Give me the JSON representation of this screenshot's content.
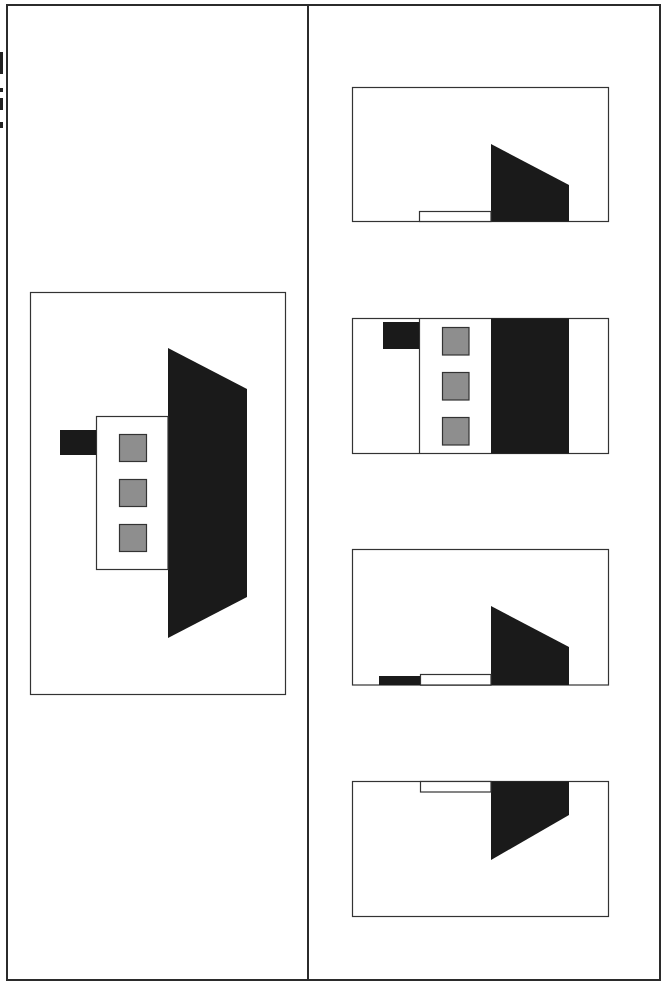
{
  "colors": {
    "frame": "#2b2b2b",
    "dark_fill": "#1a1a1a",
    "gray_fill": "#8e8e8e",
    "outline": "#333333",
    "background": "#ffffff"
  },
  "layout": {
    "left_panel": "question-figure",
    "right_panel": "answer-options"
  },
  "question": {
    "figure": {
      "box": [
        30,
        292,
        255,
        402
      ],
      "trapezoid": [
        [
          168,
          348
        ],
        [
          247,
          389
        ],
        [
          247,
          597
        ],
        [
          168,
          638
        ]
      ],
      "body_box": [
        96,
        416,
        72,
        153
      ],
      "tab": [
        60,
        430,
        36,
        25
      ],
      "squares": [
        [
          119,
          434,
          28,
          28
        ],
        [
          119,
          479,
          28,
          28
        ],
        [
          119,
          524,
          28,
          28
        ]
      ]
    }
  },
  "options": [
    {
      "id": "option-1",
      "box": [
        352,
        87,
        257,
        134
      ],
      "shapes": {
        "trapezoid": [
          [
            491,
            144
          ],
          [
            569,
            185
          ],
          [
            569,
            221
          ],
          [
            491,
            221
          ]
        ],
        "white_bar": [
          419,
          211,
          72,
          10
        ]
      }
    },
    {
      "id": "option-2",
      "box": [
        352,
        318,
        257,
        135
      ],
      "shapes": {
        "divider_x": 419,
        "dark_band": [
          491,
          318,
          78,
          135
        ],
        "tab": [
          383,
          322,
          36,
          27
        ],
        "squares": [
          [
            442,
            327,
            27,
            28
          ],
          [
            442,
            372,
            27,
            28
          ],
          [
            442,
            417,
            27,
            28
          ]
        ]
      }
    },
    {
      "id": "option-3",
      "box": [
        352,
        549,
        257,
        136
      ],
      "shapes": {
        "trapezoid": [
          [
            491,
            606
          ],
          [
            569,
            647
          ],
          [
            569,
            685
          ],
          [
            491,
            685
          ]
        ],
        "white_bar": [
          420,
          674,
          71,
          11
        ],
        "dark_bar": [
          379,
          676,
          41,
          9
        ]
      }
    },
    {
      "id": "option-4",
      "box": [
        352,
        781,
        257,
        135
      ],
      "shapes": {
        "trapezoid": [
          [
            491,
            781
          ],
          [
            569,
            781
          ],
          [
            569,
            815
          ],
          [
            491,
            860
          ]
        ],
        "white_bar": [
          420,
          781,
          71,
          11
        ]
      }
    }
  ]
}
